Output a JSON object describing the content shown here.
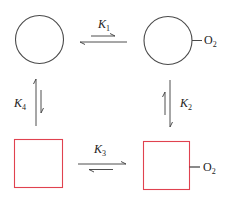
{
  "diagram": {
    "colors": {
      "circle_stroke": "#4a4a4a",
      "square_stroke": "#e0424f",
      "arrow": "#3a3a3a",
      "text": "#222222"
    },
    "nodes": [
      {
        "id": "circle-unbound",
        "shape": "circle",
        "ligand": null
      },
      {
        "id": "circle-bound",
        "shape": "circle",
        "ligand": {
          "base": "O",
          "sub": "2"
        }
      },
      {
        "id": "square-unbound",
        "shape": "square",
        "ligand": null
      },
      {
        "id": "square-bound",
        "shape": "square",
        "ligand": {
          "base": "O",
          "sub": "2"
        }
      }
    ],
    "equilibria": [
      {
        "label": {
          "base": "K",
          "sub": "1"
        },
        "from": "circle-unbound",
        "to": "circle-bound",
        "favors": "circle-unbound"
      },
      {
        "label": {
          "base": "K",
          "sub": "2"
        },
        "from": "circle-bound",
        "to": "square-bound",
        "favors": "square-bound"
      },
      {
        "label": {
          "base": "K",
          "sub": "3"
        },
        "from": "square-unbound",
        "to": "square-bound",
        "favors": "square-bound"
      },
      {
        "label": {
          "base": "K",
          "sub": "4"
        },
        "from": "square-unbound",
        "to": "circle-unbound",
        "favors": "circle-unbound"
      }
    ]
  }
}
